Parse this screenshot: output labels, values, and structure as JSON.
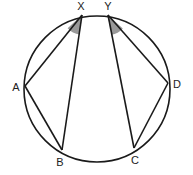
{
  "diagram": {
    "type": "circle-geometry",
    "circle": {
      "cx": 97,
      "cy": 89,
      "r": 73
    },
    "points": {
      "X": {
        "x": 82,
        "y": 15,
        "label": "X",
        "lx": 81,
        "ly": 10
      },
      "Y": {
        "x": 108,
        "y": 15,
        "label": "Y",
        "lx": 108,
        "ly": 10
      },
      "A": {
        "x": 25,
        "y": 86,
        "label": "A",
        "lx": 16,
        "ly": 91
      },
      "D": {
        "x": 168,
        "y": 83,
        "label": "D",
        "lx": 177,
        "ly": 88
      },
      "B": {
        "x": 62,
        "y": 150,
        "label": "B",
        "lx": 60,
        "ly": 166
      },
      "C": {
        "x": 134,
        "y": 148,
        "label": "C",
        "lx": 135,
        "ly": 164
      }
    },
    "segments": [
      [
        "X",
        "A"
      ],
      [
        "X",
        "B"
      ],
      [
        "A",
        "B"
      ],
      [
        "Y",
        "D"
      ],
      [
        "Y",
        "C"
      ],
      [
        "D",
        "C"
      ]
    ],
    "shaded_angles": [
      {
        "vertex": "X",
        "between": [
          "A",
          "B"
        ],
        "color": "#999999"
      },
      {
        "vertex": "Y",
        "between": [
          "D",
          "C"
        ],
        "color": "#999999"
      }
    ],
    "colors": {
      "stroke": "#1a1a1a",
      "shade": "#999999",
      "background": "#ffffff"
    }
  }
}
